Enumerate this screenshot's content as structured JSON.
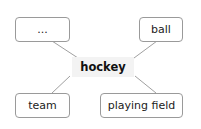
{
  "diagram": {
    "type": "mind-map",
    "center": {
      "label": "hockey"
    },
    "nodes": [
      {
        "id": "top-left",
        "label": "..."
      },
      {
        "id": "top-right",
        "label": "ball"
      },
      {
        "id": "bottom-left",
        "label": "team"
      },
      {
        "id": "bottom-right",
        "label": "playing field"
      }
    ],
    "colors": {
      "border": "#9a9a9a",
      "line": "#9a9a9a",
      "center_bg": "#f3f3f3",
      "text": "#222222"
    }
  }
}
